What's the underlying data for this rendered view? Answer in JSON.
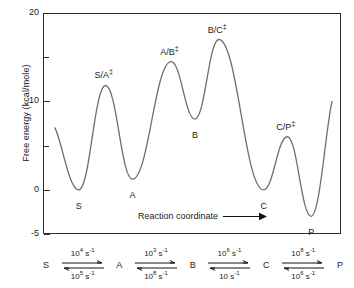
{
  "axis": {
    "ylabel": "Free energy (kcal/mole)",
    "ticks": [
      {
        "value": 20,
        "label": "20",
        "minor": false
      },
      {
        "value": 15,
        "label": "",
        "minor": true
      },
      {
        "value": 10,
        "label": "10",
        "minor": false
      },
      {
        "value": 5,
        "label": "",
        "minor": true
      },
      {
        "value": 0,
        "label": "0",
        "minor": false
      },
      {
        "value": -5,
        "label": "-5",
        "minor": false
      }
    ]
  },
  "annotation": {
    "reaction_coordinate": "Reaction coordinate",
    "arrow_icon": "right-arrow-icon"
  },
  "curve_labels": [
    {
      "name": "S",
      "text": "S",
      "sup": ""
    },
    {
      "name": "S/A-dagger",
      "text": "S/A",
      "sup": "‡"
    },
    {
      "name": "A",
      "text": "A",
      "sup": ""
    },
    {
      "name": "A/B-dagger",
      "text": "A/B",
      "sup": "‡"
    },
    {
      "name": "B",
      "text": "B",
      "sup": ""
    },
    {
      "name": "B/C-dagger",
      "text": "B/C",
      "sup": "‡"
    },
    {
      "name": "C",
      "text": "C",
      "sup": ""
    },
    {
      "name": "C/P-dagger",
      "text": "C/P",
      "sup": "‡"
    },
    {
      "name": "P",
      "text": "P",
      "sup": ""
    }
  ],
  "scheme": {
    "species": [
      "S",
      "A",
      "B",
      "C",
      "P"
    ],
    "steps": [
      {
        "forward_base": "10",
        "forward_exp": "4",
        "forward_unit": " s",
        "forward_unit_exp": "-1",
        "reverse_base": "10",
        "reverse_exp": "5",
        "reverse_unit": " s",
        "reverse_unit_exp": "-1"
      },
      {
        "forward_base": "10",
        "forward_exp": "3",
        "forward_unit": " s",
        "forward_unit_exp": "-1",
        "reverse_base": "10",
        "reverse_exp": "8",
        "reverse_unit": " s",
        "reverse_unit_exp": "-1"
      },
      {
        "forward_base": "10",
        "forward_exp": "6",
        "forward_unit": " s",
        "forward_unit_exp": "-1",
        "reverse_base": "10",
        "reverse_exp": "",
        "reverse_unit": " s",
        "reverse_unit_exp": "-1"
      },
      {
        "forward_base": "10",
        "forward_exp": "8",
        "forward_unit": " s",
        "forward_unit_exp": "-1",
        "reverse_base": "10",
        "reverse_exp": "6",
        "reverse_unit": " s",
        "reverse_unit_exp": "-1"
      }
    ]
  },
  "chart_data": {
    "type": "line",
    "title": "",
    "xlabel": "Reaction coordinate",
    "ylabel": "Free energy (kcal/mole)",
    "ylim": [
      -5,
      20
    ],
    "xlim": [
      0,
      100
    ],
    "grid": false,
    "legend": "none",
    "ytick_values": [
      20,
      15,
      10,
      5,
      0,
      -5
    ],
    "ytick_labels": [
      "20",
      "",
      "10",
      "",
      "0",
      "-5"
    ],
    "stationary_points": [
      {
        "label": "start",
        "x": 4,
        "y": 7.0,
        "kind": "endpoint"
      },
      {
        "label": "S",
        "x": 12,
        "y": 0.0,
        "kind": "minimum"
      },
      {
        "label": "S/A‡",
        "x": 21,
        "y": 11.8,
        "kind": "maximum"
      },
      {
        "label": "A",
        "x": 30,
        "y": 1.2,
        "kind": "minimum"
      },
      {
        "label": "A/B‡",
        "x": 43,
        "y": 14.5,
        "kind": "maximum"
      },
      {
        "label": "B",
        "x": 51,
        "y": 8.0,
        "kind": "minimum"
      },
      {
        "label": "B/C‡",
        "x": 59,
        "y": 17.0,
        "kind": "maximum"
      },
      {
        "label": "C",
        "x": 74,
        "y": 0.0,
        "kind": "minimum"
      },
      {
        "label": "C/P‡",
        "x": 82,
        "y": 6.0,
        "kind": "maximum"
      },
      {
        "label": "P",
        "x": 90,
        "y": -3.0,
        "kind": "minimum"
      },
      {
        "label": "end",
        "x": 97,
        "y": 10.0,
        "kind": "endpoint"
      }
    ],
    "rate_constants": [
      {
        "from": "S",
        "to": "A",
        "forward": "10^4 s^-1",
        "reverse": "10^5 s^-1"
      },
      {
        "from": "A",
        "to": "B",
        "forward": "10^3 s^-1",
        "reverse": "10^8 s^-1"
      },
      {
        "from": "B",
        "to": "C",
        "forward": "10^6 s^-1",
        "reverse": "10 s^-1"
      },
      {
        "from": "C",
        "to": "P",
        "forward": "10^8 s^-1",
        "reverse": "10^6 s^-1"
      }
    ]
  }
}
